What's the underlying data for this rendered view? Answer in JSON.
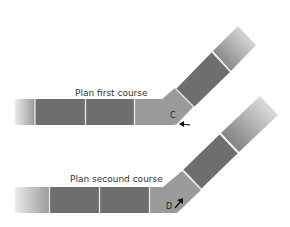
{
  "diagram": {
    "courses": [
      {
        "label": "Plan first course",
        "corner_letter": "C",
        "arrow": "left-arrow"
      },
      {
        "label": "Plan secound course",
        "corner_letter": "D",
        "arrow": "up-right-arrow"
      }
    ],
    "colors": {
      "brick_dark": "#6e6e6e",
      "brick_light": "#9a9a9a",
      "joint": "#e8e8e8",
      "text": "#333333"
    }
  }
}
